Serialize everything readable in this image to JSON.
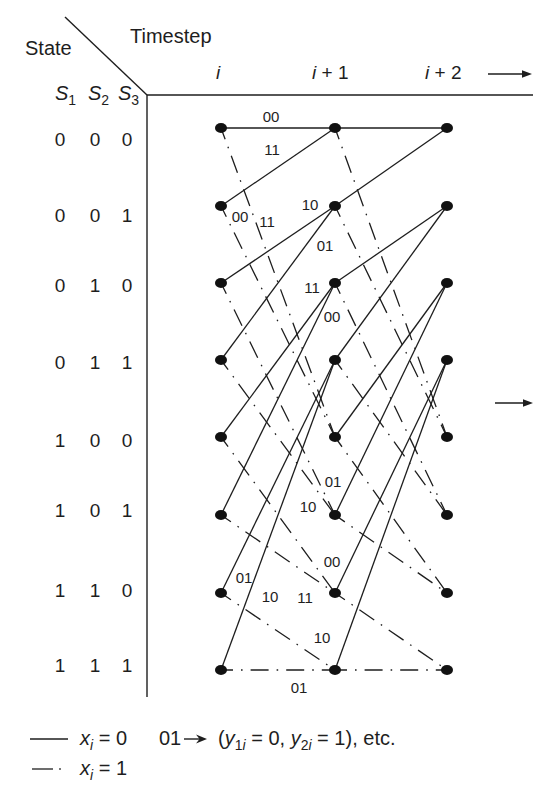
{
  "header": {
    "state_label": "State",
    "timestep_label": "Timestep",
    "state_bits": [
      {
        "symbol": "S",
        "sub": "1"
      },
      {
        "symbol": "S",
        "sub": "2"
      },
      {
        "symbol": "S",
        "sub": "3"
      }
    ]
  },
  "timesteps": [
    {
      "var": "i",
      "suffix": ""
    },
    {
      "var": "i",
      "suffix": " + 1"
    },
    {
      "var": "i",
      "suffix": " + 2"
    }
  ],
  "states": [
    {
      "bits": [
        "0",
        "0",
        "0"
      ]
    },
    {
      "bits": [
        "0",
        "0",
        "1"
      ]
    },
    {
      "bits": [
        "0",
        "1",
        "0"
      ]
    },
    {
      "bits": [
        "0",
        "1",
        "1"
      ]
    },
    {
      "bits": [
        "1",
        "0",
        "0"
      ]
    },
    {
      "bits": [
        "1",
        "0",
        "1"
      ]
    },
    {
      "bits": [
        "1",
        "1",
        "0"
      ]
    },
    {
      "bits": [
        "1",
        "1",
        "1"
      ]
    }
  ],
  "transitions": [
    {
      "from": "000",
      "to": "000",
      "input": 0,
      "output": "00"
    },
    {
      "from": "000",
      "to": "100",
      "input": 1,
      "output": "11"
    },
    {
      "from": "001",
      "to": "000",
      "input": 0,
      "output": "11"
    },
    {
      "from": "001",
      "to": "100",
      "input": 1,
      "output": "00"
    },
    {
      "from": "010",
      "to": "001",
      "input": 0,
      "output": "10"
    },
    {
      "from": "010",
      "to": "101",
      "input": 1,
      "output": "01"
    },
    {
      "from": "011",
      "to": "001",
      "input": 0,
      "output": "01"
    },
    {
      "from": "011",
      "to": "101",
      "input": 1,
      "output": "10"
    },
    {
      "from": "100",
      "to": "010",
      "input": 0,
      "output": "11"
    },
    {
      "from": "100",
      "to": "110",
      "input": 1,
      "output": "00"
    },
    {
      "from": "101",
      "to": "010",
      "input": 0,
      "output": "00"
    },
    {
      "from": "101",
      "to": "110",
      "input": 1,
      "output": "11"
    },
    {
      "from": "110",
      "to": "011",
      "input": 0,
      "output": "01"
    },
    {
      "from": "110",
      "to": "111",
      "input": 1,
      "output": "10"
    },
    {
      "from": "111",
      "to": "011",
      "input": 0,
      "output": "10"
    },
    {
      "from": "111",
      "to": "111",
      "input": 1,
      "output": "01"
    }
  ],
  "legend": {
    "items": [
      {
        "line_style": "solid",
        "var": "x",
        "sub": "i",
        "relation": " = 0"
      },
      {
        "line_style": "dash-dot",
        "var": "x",
        "sub": "i",
        "relation": " = 1"
      }
    ],
    "example": {
      "code": "01",
      "open": "(",
      "terms": [
        {
          "var": "y",
          "sub_num": "1",
          "sub_var": "i",
          "relation": " = 0",
          "sep": ", "
        },
        {
          "var": "y",
          "sub_num": "2",
          "sub_var": "i",
          "relation": " = 1",
          "sep": ""
        }
      ],
      "close": "), etc."
    }
  },
  "icons": {
    "timestep_direction": "right-arrow-icon",
    "continuation": "right-arrow-icon",
    "example_mapping": "right-arrow-icon"
  },
  "colors": {
    "ink": "#1e1e1e",
    "background": "#ffffff"
  }
}
